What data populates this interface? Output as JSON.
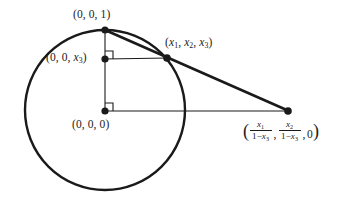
{
  "figure": {
    "type": "geometry-diagram",
    "background_color": "#ffffff",
    "stroke_color": "#1a1a1a",
    "width": 349,
    "height": 208
  },
  "circle": {
    "center_x": 105,
    "center_y": 110,
    "radius": 80,
    "stroke_width": 2.4
  },
  "points": [
    {
      "id": "north-pole",
      "x": 105,
      "y": 30,
      "label": "(0, 0, 1)"
    },
    {
      "id": "height-x3",
      "x": 105,
      "y": 59,
      "label": "(0, 0, x3)"
    },
    {
      "id": "origin",
      "x": 105,
      "y": 111,
      "label": "(0, 0, 0)"
    },
    {
      "id": "sphere-point",
      "x": 167,
      "y": 58,
      "label": "(x1, x2, x3)"
    },
    {
      "id": "projected-point",
      "x": 288,
      "y": 111,
      "label": "projection"
    }
  ],
  "labels": {
    "north_pole": {
      "open": "(",
      "zero_a": "0",
      "comma_a": ", ",
      "zero_b": "0",
      "comma_b": ", ",
      "one": "1",
      "close": ")"
    },
    "height_x3": {
      "open": "(",
      "zero_a": "0",
      "comma_a": ", ",
      "zero_b": "0",
      "comma_b": ", ",
      "var": "x",
      "sub": "3",
      "close": ")"
    },
    "origin": {
      "open": "(",
      "zero_a": "0",
      "comma_a": ", ",
      "zero_b": "0",
      "comma_b": ", ",
      "zero_c": "0",
      "close": ")"
    },
    "sphere_point": {
      "open": "(",
      "var1": "x",
      "sub1": "1",
      "comma_a": ", ",
      "var2": "x",
      "sub2": "2",
      "comma_b": ", ",
      "var3": "x",
      "sub3": "3",
      "close": ")"
    },
    "projected_point": {
      "open": "(",
      "frac1_num_var": "x",
      "frac1_num_sub": "1",
      "frac1_den_one": "1−",
      "frac1_den_var": "x",
      "frac1_den_sub": "3",
      "comma_a": ",",
      "frac2_num_var": "x",
      "frac2_num_sub": "2",
      "frac2_den_one": "1−",
      "frac2_den_var": "x",
      "frac2_den_sub": "3",
      "comma_b": ",",
      "zero": "0",
      "close": ")"
    }
  },
  "segments": [
    {
      "id": "vertical-axis",
      "x1": 105,
      "y1": 30,
      "x2": 105,
      "y2": 111,
      "width": 1.1
    },
    {
      "id": "horizontal-upper",
      "x1": 105,
      "y1": 59,
      "x2": 167,
      "y2": 58,
      "width": 1.1
    },
    {
      "id": "horizontal-baseline",
      "x1": 105,
      "y1": 111,
      "x2": 288,
      "y2": 111,
      "width": 1.1
    },
    {
      "id": "projection-ray",
      "x1": 105,
      "y1": 30,
      "x2": 288,
      "y2": 111,
      "width": 2.6
    }
  ],
  "right_angle_marks": [
    {
      "id": "right-angle-upper",
      "x": 105,
      "y": 59,
      "size": 8
    },
    {
      "id": "right-angle-lower",
      "x": 105,
      "y": 111,
      "size": 8
    }
  ]
}
